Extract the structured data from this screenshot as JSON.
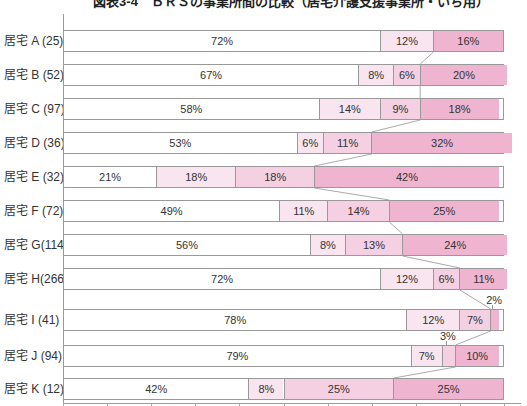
{
  "chart_data": {
    "type": "stacked-bar-horizontal",
    "title": "図表3-4　ＢＲＳの事業所間の比較（居宅介護支援事業所・いち用）",
    "unit": "%",
    "x_axis": {
      "min": 0,
      "max": 100,
      "tick_step_percent": 10,
      "gridlines": false
    },
    "legend": "none-visible",
    "category_colors": [
      "#ffffff",
      "#f8e5ef",
      "#f4d0e2",
      "#efb5d0"
    ],
    "bar_border_color": "#999999",
    "connector_color": "#aaaaaa",
    "text_color": "#333333",
    "rows": [
      {
        "label": "居宅 A (25)",
        "n": 25,
        "values": [
          72,
          12,
          0,
          16
        ],
        "value_labels": [
          "72%",
          "12%",
          "",
          "16%"
        ],
        "outside_label_indexes": []
      },
      {
        "label": "居宅 B (52)",
        "n": 52,
        "values": [
          67,
          8,
          6,
          20
        ],
        "value_labels": [
          "67%",
          "8%",
          "6%",
          "20%"
        ],
        "outside_label_indexes": []
      },
      {
        "label": "居宅 C (97)",
        "n": 97,
        "values": [
          58,
          14,
          9,
          18
        ],
        "value_labels": [
          "58%",
          "14%",
          "9%",
          "18%"
        ],
        "outside_label_indexes": []
      },
      {
        "label": "居宅 D (36)",
        "n": 36,
        "values": [
          53,
          6,
          11,
          32
        ],
        "value_labels": [
          "53%",
          "6%",
          "11%",
          "32%"
        ],
        "outside_label_indexes": []
      },
      {
        "label": "居宅 E (32)",
        "n": 32,
        "values": [
          21,
          18,
          18,
          42
        ],
        "value_labels": [
          "21%",
          "18%",
          "18%",
          "42%"
        ],
        "outside_label_indexes": []
      },
      {
        "label": "居宅 F (72)",
        "n": 72,
        "values": [
          49,
          11,
          14,
          25
        ],
        "value_labels": [
          "49%",
          "11%",
          "14%",
          "25%"
        ],
        "outside_label_indexes": []
      },
      {
        "label": "居宅 G(114)",
        "n": 114,
        "values": [
          56,
          8,
          13,
          24
        ],
        "value_labels": [
          "56%",
          "8%",
          "13%",
          "24%"
        ],
        "outside_label_indexes": []
      },
      {
        "label": "居宅 H(266)",
        "n": 266,
        "values": [
          72,
          12,
          6,
          11
        ],
        "value_labels": [
          "72%",
          "12%",
          "6%",
          "11%"
        ],
        "outside_label_indexes": []
      },
      {
        "label": "居宅 I (41)",
        "n": 41,
        "values": [
          78,
          12,
          7,
          2
        ],
        "value_labels": [
          "78%",
          "12%",
          "7%",
          "2%"
        ],
        "outside_label_indexes": [
          3
        ]
      },
      {
        "label": "居宅 J (94)",
        "n": 94,
        "values": [
          79,
          7,
          3,
          10
        ],
        "value_labels": [
          "79%",
          "7%",
          "3%",
          "10%"
        ],
        "outside_label_indexes": [
          2
        ]
      },
      {
        "label": "居宅 K (12)",
        "n": 12,
        "values": [
          42,
          8,
          25,
          25
        ],
        "value_labels": [
          "42%",
          "8%",
          "25%",
          "25%"
        ],
        "outside_label_indexes": []
      }
    ]
  }
}
